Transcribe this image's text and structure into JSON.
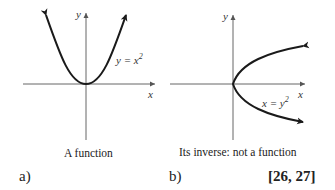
{
  "figure": {
    "panels": [
      {
        "id": "a",
        "tag": "a)",
        "caption": "A function",
        "axis_x_label": "x",
        "axis_y_label": "y",
        "curve_label_lhs": "y = x",
        "curve_label_exp": "2",
        "equation": "y = x^2"
      },
      {
        "id": "b",
        "tag": "b)",
        "caption": "Its inverse: not a function",
        "axis_x_label": "x",
        "axis_y_label": "y",
        "curve_label_lhs": "x = y",
        "curve_label_exp": "2",
        "equation": "x = y^2"
      }
    ],
    "reference": "[26, 27]"
  },
  "colors": {
    "curve": "#1a1a1a",
    "axis": "#555555",
    "background": "#ffffff"
  }
}
